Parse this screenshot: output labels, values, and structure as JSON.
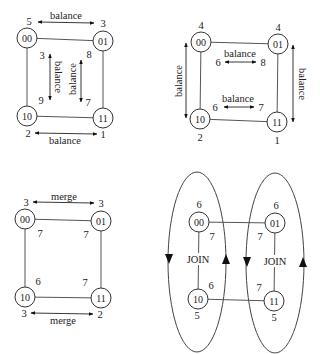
{
  "diagrams": [
    {
      "id": "balance-diagonal",
      "nodes": [
        {
          "id": "00",
          "label": "00",
          "x": 27,
          "y": 38
        },
        {
          "id": "01",
          "label": "01",
          "x": 103,
          "y": 41
        },
        {
          "id": "10",
          "label": "10",
          "x": 27,
          "y": 116
        },
        {
          "id": "11",
          "label": "11",
          "x": 103,
          "y": 118
        }
      ],
      "edges": [
        [
          "00",
          "01"
        ],
        [
          "00",
          "10"
        ],
        [
          "01",
          "11"
        ],
        [
          "10",
          "11"
        ]
      ],
      "arrows": [
        {
          "x1": 38,
          "y1": 22,
          "x2": 94,
          "y2": 23,
          "label": "balance",
          "lx": 66,
          "ly": 15,
          "rot": 0
        },
        {
          "x1": 35,
          "y1": 133,
          "x2": 97,
          "y2": 134,
          "label": "balance",
          "lx": 65,
          "ly": 140,
          "rot": 0
        },
        {
          "x1": 50,
          "y1": 54,
          "x2": 50,
          "y2": 100,
          "label": "balance",
          "lx": 58,
          "ly": 77,
          "rot": 90
        },
        {
          "x1": 81,
          "y1": 60,
          "x2": 81,
          "y2": 102,
          "label": "balance",
          "lx": 72,
          "ly": 79,
          "rot": -90
        }
      ],
      "numbers": [
        {
          "text": "5",
          "x": 29,
          "y": 21
        },
        {
          "text": "3",
          "x": 103,
          "y": 23
        },
        {
          "text": "3",
          "x": 42,
          "y": 55
        },
        {
          "text": "8",
          "x": 89,
          "y": 54
        },
        {
          "text": "9",
          "x": 41,
          "y": 100
        },
        {
          "text": "7",
          "x": 88,
          "y": 102
        },
        {
          "text": "2",
          "x": 28,
          "y": 133
        },
        {
          "text": "1",
          "x": 103,
          "y": 134
        }
      ]
    },
    {
      "id": "balance-dimension",
      "nodes": [
        {
          "id": "00",
          "label": "00",
          "x": 201,
          "y": 42
        },
        {
          "id": "01",
          "label": "01",
          "x": 278,
          "y": 44
        },
        {
          "id": "10",
          "label": "10",
          "x": 200,
          "y": 119
        },
        {
          "id": "11",
          "label": "11",
          "x": 277,
          "y": 122
        }
      ],
      "edges": [
        [
          "00",
          "01"
        ],
        [
          "00",
          "10"
        ],
        [
          "01",
          "11"
        ],
        [
          "10",
          "11"
        ]
      ],
      "arrows": [
        {
          "x1": 225,
          "y1": 62,
          "x2": 256,
          "y2": 62,
          "label": "balance",
          "lx": 240,
          "ly": 53,
          "rot": 0
        },
        {
          "x1": 224,
          "y1": 107,
          "x2": 254,
          "y2": 107,
          "label": "balance",
          "lx": 238,
          "ly": 98,
          "rot": 0
        },
        {
          "x1": 186,
          "y1": 43,
          "x2": 186,
          "y2": 118,
          "label": "balance",
          "lx": 178,
          "ly": 81,
          "rot": -90
        },
        {
          "x1": 293,
          "y1": 45,
          "x2": 293,
          "y2": 122,
          "label": "balance",
          "lx": 302,
          "ly": 84,
          "rot": 90
        }
      ],
      "numbers": [
        {
          "text": "4",
          "x": 201,
          "y": 25
        },
        {
          "text": "4",
          "x": 278,
          "y": 27
        },
        {
          "text": "6",
          "x": 218,
          "y": 62
        },
        {
          "text": "8",
          "x": 263,
          "y": 62
        },
        {
          "text": "6",
          "x": 215,
          "y": 107
        },
        {
          "text": "7",
          "x": 261,
          "y": 107
        },
        {
          "text": "2",
          "x": 200,
          "y": 137
        },
        {
          "text": "1",
          "x": 277,
          "y": 140
        }
      ]
    },
    {
      "id": "merge",
      "nodes": [
        {
          "id": "00",
          "label": "00",
          "x": 25,
          "y": 219
        },
        {
          "id": "01",
          "label": "01",
          "x": 101,
          "y": 221
        },
        {
          "id": "10",
          "label": "10",
          "x": 25,
          "y": 297
        },
        {
          "id": "11",
          "label": "11",
          "x": 101,
          "y": 298
        }
      ],
      "edges": [
        [
          "00",
          "01"
        ],
        [
          "00",
          "10"
        ],
        [
          "01",
          "11"
        ],
        [
          "10",
          "11"
        ]
      ],
      "arrows": [
        {
          "x1": 33,
          "y1": 202,
          "x2": 94,
          "y2": 203,
          "label": "merge",
          "lx": 64,
          "ly": 196,
          "rot": 0
        },
        {
          "x1": 31,
          "y1": 313,
          "x2": 93,
          "y2": 314,
          "label": "merge",
          "lx": 63,
          "ly": 320,
          "rot": 0
        }
      ],
      "numbers": [
        {
          "text": "3",
          "x": 26,
          "y": 202
        },
        {
          "text": "3",
          "x": 101,
          "y": 203
        },
        {
          "text": "7",
          "x": 40,
          "y": 233
        },
        {
          "text": "7",
          "x": 86,
          "y": 234
        },
        {
          "text": "6",
          "x": 38,
          "y": 281
        },
        {
          "text": "7",
          "x": 85,
          "y": 282
        },
        {
          "text": "3",
          "x": 24,
          "y": 313
        },
        {
          "text": "2",
          "x": 100,
          "y": 314
        }
      ]
    },
    {
      "id": "join",
      "nodes": [
        {
          "id": "00",
          "label": "00",
          "x": 199,
          "y": 222
        },
        {
          "id": "01",
          "label": "01",
          "x": 275,
          "y": 223
        },
        {
          "id": "10",
          "label": "10",
          "x": 198,
          "y": 299
        },
        {
          "id": "11",
          "label": "11",
          "x": 274,
          "y": 301
        }
      ],
      "edges": [
        [
          "00",
          "01"
        ],
        [
          "00",
          "10"
        ],
        [
          "01",
          "11"
        ],
        [
          "10",
          "11"
        ]
      ],
      "ellipses": [
        {
          "cx": 197,
          "cy": 262,
          "rx": 29,
          "ry": 90,
          "down_x": 169,
          "up_x": 226,
          "arrow_y": 259
        },
        {
          "cx": 275,
          "cy": 263,
          "rx": 29,
          "ry": 90,
          "down_x": 247,
          "up_x": 303,
          "arrow_y": 262
        }
      ],
      "join_labels": [
        {
          "text": "JOIN",
          "x": 198,
          "y": 259
        },
        {
          "text": "JOIN",
          "x": 275,
          "y": 261
        }
      ],
      "arrows": [],
      "numbers": [
        {
          "text": "6",
          "x": 199,
          "y": 204
        },
        {
          "text": "7",
          "x": 212,
          "y": 236
        },
        {
          "text": "6",
          "x": 211,
          "y": 285
        },
        {
          "text": "5",
          "x": 197,
          "y": 315
        },
        {
          "text": "6",
          "x": 276,
          "y": 205
        },
        {
          "text": "7",
          "x": 260,
          "y": 236
        },
        {
          "text": "7",
          "x": 259,
          "y": 287
        },
        {
          "text": "5",
          "x": 274,
          "y": 317
        }
      ]
    }
  ],
  "node_radius": 10,
  "colors": {
    "stroke": "#444444",
    "text": "#222222",
    "background": "#ffffff"
  }
}
